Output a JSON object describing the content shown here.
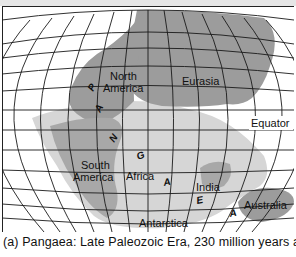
{
  "figure": {
    "caption": "(a)  Pangaea: Late Paleozoic Era, 230 million years ago.",
    "colors": {
      "land_dark": "#9c9c9c",
      "land_light": "#d4d4d4",
      "grid": "#1a1a1a",
      "ocean": "#ffffff"
    }
  },
  "map": {
    "labels": {
      "north_america_1": "North",
      "north_america_2": "America",
      "eurasia": "Eurasia",
      "equator": "Equator",
      "south_america_1": "South",
      "south_america_2": "America",
      "africa": "Africa",
      "india": "India",
      "australia": "Australia",
      "antarctica": "Antarctica"
    },
    "pangaea_letters": [
      "P",
      "A",
      "N",
      "G",
      "A",
      "E",
      "A"
    ]
  }
}
